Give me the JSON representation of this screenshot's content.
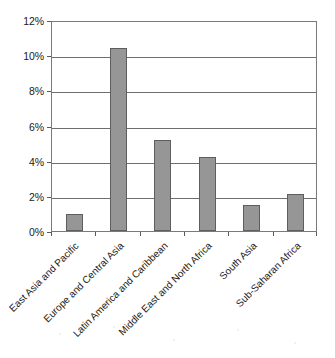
{
  "chart_data": {
    "type": "bar",
    "title": "",
    "subtitle": "",
    "xlabel": "",
    "ylabel": "",
    "categories": [
      "East Asia and Pacific",
      "Europe and Central Asia",
      "Latin America and Caribbean",
      "Middle East and North Africa",
      "South Asia",
      "Sub-Saharan Africa"
    ],
    "values": [
      0.95,
      10.4,
      5.2,
      4.2,
      1.5,
      2.1
    ],
    "value_format": "percent",
    "ylim": [
      0,
      12
    ],
    "ytick_values": [
      0,
      2,
      4,
      6,
      8,
      10,
      12
    ],
    "ytick_labels": [
      "0%",
      "2%",
      "4%",
      "6%",
      "8%",
      "10%",
      "12%"
    ],
    "grid": true,
    "grid_axis": "y",
    "legend": false,
    "legend_position": "none",
    "orientation": "vertical",
    "xtick_label_rotation": -45
  },
  "style": {
    "bar_fill": "#969696",
    "bar_border": "#5e5e5e",
    "gridline_color": "#6e6e6e",
    "frame_color": "#7a7a7a",
    "text_color": "#1a1a1a",
    "background": "#ffffff"
  }
}
